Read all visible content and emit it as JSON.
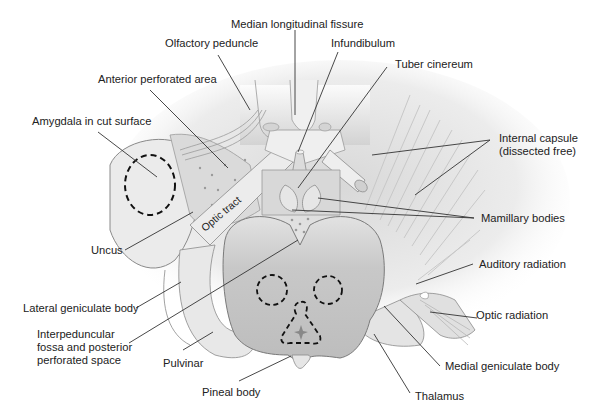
{
  "diagram": {
    "labels": {
      "median_longitudinal_fissure": "Median longitudinal fissure",
      "olfactory_peduncle": "Olfactory peduncle",
      "infundibulum": "Infundibulum",
      "tuber_cinereum": "Tuber cinereum",
      "anterior_perforated_area": "Anterior perforated area",
      "amygdala": "Amygdala in cut surface",
      "internal_capsule": "Internal capsule\n(dissected free)",
      "optic_tract": "Optic tract",
      "mamillary_bodies": "Mamillary bodies",
      "uncus": "Uncus",
      "auditory_radiation": "Auditory radiation",
      "lateral_geniculate_body": "Lateral geniculate body",
      "optic_radiation": "Optic radiation",
      "interpeduncular": "Interpeduncular\nfossa and posterior\nperforated space",
      "pulvinar": "Pulvinar",
      "medial_geniculate_body": "Medial geniculate body",
      "pineal_body": "Pineal body",
      "thalamus": "Thalamus"
    },
    "colors": {
      "tissue_light": "#e6e6e6",
      "tissue_mid": "#d2d2d2",
      "tissue_dark": "#bdbdbd",
      "midbrain": "#c4c4c4",
      "outline": "#7a7a7a",
      "leader": "#333333",
      "dashed": "#111111"
    }
  }
}
